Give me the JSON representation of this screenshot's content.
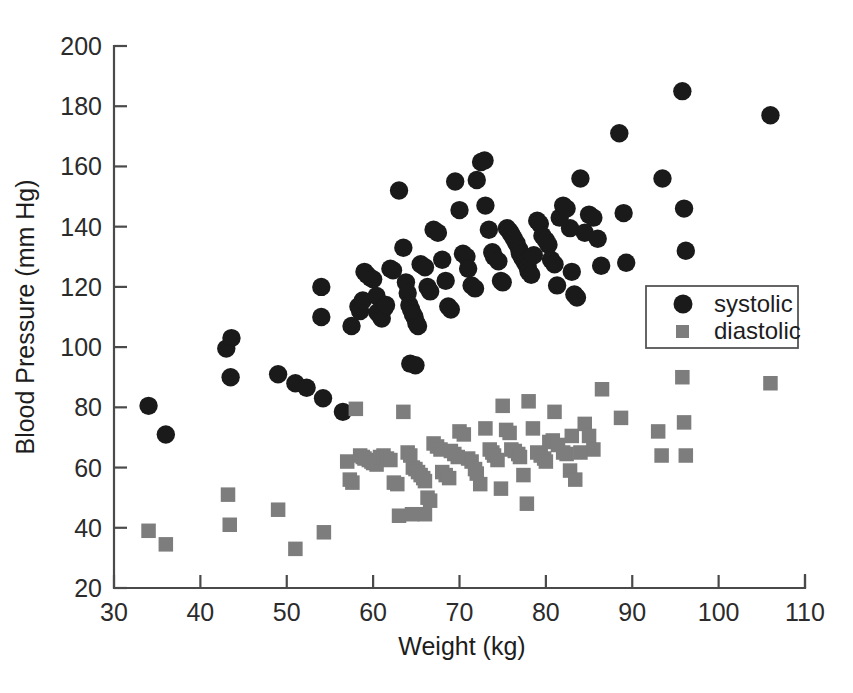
{
  "chart_data": {
    "type": "scatter",
    "title": "",
    "xlabel": "Weight (kg)",
    "ylabel": "Blood Pressure (mm Hg)",
    "xlim": [
      30,
      110
    ],
    "ylim": [
      20,
      200
    ],
    "xticks": [
      30,
      40,
      50,
      60,
      70,
      80,
      90,
      100,
      110
    ],
    "yticks": [
      20,
      40,
      60,
      80,
      100,
      120,
      140,
      160,
      180,
      200
    ],
    "grid": false,
    "legend_position": "center-right",
    "series": [
      {
        "name": "systolic",
        "marker": "circle",
        "color": "#1a1a1a",
        "points": [
          [
            34.0,
            80.5
          ],
          [
            36.0,
            71.0
          ],
          [
            43.0,
            99.5
          ],
          [
            43.6,
            103.0
          ],
          [
            43.5,
            90.0
          ],
          [
            49.0,
            91.0
          ],
          [
            51.0,
            88.0
          ],
          [
            52.3,
            86.5
          ],
          [
            54.2,
            83.0
          ],
          [
            56.5,
            78.5
          ],
          [
            54.0,
            120.0
          ],
          [
            54.0,
            110.0
          ],
          [
            57.5,
            107.0
          ],
          [
            58.3,
            113.5
          ],
          [
            58.5,
            112.0
          ],
          [
            58.8,
            115.5
          ],
          [
            59.0,
            125.0
          ],
          [
            59.3,
            124.0
          ],
          [
            59.7,
            123.0
          ],
          [
            60.0,
            122.5
          ],
          [
            60.4,
            117.0
          ],
          [
            60.5,
            111.5
          ],
          [
            60.8,
            110.5
          ],
          [
            61.0,
            109.5
          ],
          [
            61.3,
            113.0
          ],
          [
            61.5,
            114.0
          ],
          [
            62.0,
            126.0
          ],
          [
            62.3,
            125.5
          ],
          [
            63.0,
            152.0
          ],
          [
            63.5,
            133.0
          ],
          [
            63.8,
            121.5
          ],
          [
            64.0,
            118.0
          ],
          [
            64.2,
            114.0
          ],
          [
            64.4,
            112.5
          ],
          [
            64.6,
            111.0
          ],
          [
            64.8,
            110.0
          ],
          [
            65.0,
            108.0
          ],
          [
            65.2,
            107.0
          ],
          [
            64.3,
            94.5
          ],
          [
            64.9,
            94.0
          ],
          [
            65.5,
            127.5
          ],
          [
            66.0,
            126.5
          ],
          [
            66.3,
            120.0
          ],
          [
            66.6,
            118.5
          ],
          [
            67.0,
            139.0
          ],
          [
            67.5,
            138.0
          ],
          [
            68.0,
            129.0
          ],
          [
            68.4,
            122.0
          ],
          [
            68.7,
            113.5
          ],
          [
            69.0,
            112.5
          ],
          [
            69.5,
            155.0
          ],
          [
            70.0,
            145.5
          ],
          [
            70.4,
            131.0
          ],
          [
            70.8,
            130.0
          ],
          [
            71.0,
            126.0
          ],
          [
            71.4,
            120.5
          ],
          [
            71.8,
            119.5
          ],
          [
            72.0,
            155.5
          ],
          [
            72.5,
            161.5
          ],
          [
            72.9,
            162.0
          ],
          [
            73.0,
            147.0
          ],
          [
            73.4,
            139.0
          ],
          [
            73.8,
            131.5
          ],
          [
            74.0,
            130.0
          ],
          [
            74.5,
            128.5
          ],
          [
            74.8,
            122.0
          ],
          [
            75.0,
            121.5
          ],
          [
            75.5,
            139.5
          ],
          [
            75.8,
            138.5
          ],
          [
            76.0,
            137.5
          ],
          [
            76.3,
            136.0
          ],
          [
            76.6,
            134.5
          ],
          [
            76.9,
            132.5
          ],
          [
            77.0,
            131.0
          ],
          [
            77.3,
            129.5
          ],
          [
            77.6,
            128.0
          ],
          [
            77.9,
            126.5
          ],
          [
            78.0,
            125.0
          ],
          [
            78.3,
            124.0
          ],
          [
            78.6,
            130.5
          ],
          [
            79.0,
            142.0
          ],
          [
            79.3,
            141.0
          ],
          [
            79.6,
            137.0
          ],
          [
            80.0,
            135.5
          ],
          [
            80.3,
            134.0
          ],
          [
            80.6,
            129.0
          ],
          [
            81.0,
            127.5
          ],
          [
            81.3,
            120.5
          ],
          [
            81.6,
            143.0
          ],
          [
            82.0,
            147.0
          ],
          [
            82.4,
            146.0
          ],
          [
            82.8,
            139.5
          ],
          [
            83.0,
            125.0
          ],
          [
            83.3,
            117.5
          ],
          [
            83.6,
            116.5
          ],
          [
            84.0,
            156.0
          ],
          [
            84.5,
            138.0
          ],
          [
            85.0,
            144.0
          ],
          [
            85.5,
            143.0
          ],
          [
            86.0,
            136.0
          ],
          [
            86.4,
            127.0
          ],
          [
            88.5,
            171.0
          ],
          [
            89.0,
            144.5
          ],
          [
            89.3,
            128.0
          ],
          [
            93.5,
            156.0
          ],
          [
            95.8,
            185.0
          ],
          [
            96.0,
            146.0
          ],
          [
            96.2,
            132.0
          ],
          [
            106.0,
            177.0
          ]
        ]
      },
      {
        "name": "diastolic",
        "marker": "square",
        "color": "#7d7d7d",
        "points": [
          [
            34.0,
            39.0
          ],
          [
            36.0,
            34.5
          ],
          [
            43.2,
            51.0
          ],
          [
            43.4,
            41.0
          ],
          [
            49.0,
            46.0
          ],
          [
            51.0,
            33.0
          ],
          [
            54.3,
            38.5
          ],
          [
            57.0,
            62.0
          ],
          [
            57.3,
            56.0
          ],
          [
            57.6,
            55.0
          ],
          [
            58.0,
            79.5
          ],
          [
            58.5,
            64.0
          ],
          [
            58.8,
            63.5
          ],
          [
            59.0,
            63.0
          ],
          [
            59.5,
            62.5
          ],
          [
            59.8,
            62.0
          ],
          [
            60.0,
            61.5
          ],
          [
            60.4,
            61.0
          ],
          [
            60.8,
            63.5
          ],
          [
            61.2,
            64.0
          ],
          [
            61.6,
            63.0
          ],
          [
            62.0,
            62.5
          ],
          [
            62.4,
            55.0
          ],
          [
            62.8,
            54.5
          ],
          [
            63.0,
            44.0
          ],
          [
            63.5,
            78.5
          ],
          [
            64.0,
            65.0
          ],
          [
            64.3,
            64.0
          ],
          [
            64.6,
            60.0
          ],
          [
            64.9,
            59.5
          ],
          [
            65.2,
            58.5
          ],
          [
            65.5,
            57.5
          ],
          [
            65.8,
            56.5
          ],
          [
            66.0,
            55.5
          ],
          [
            66.3,
            50.0
          ],
          [
            66.6,
            49.0
          ],
          [
            64.5,
            44.5
          ],
          [
            66.0,
            44.5
          ],
          [
            67.0,
            68.0
          ],
          [
            67.4,
            67.0
          ],
          [
            67.8,
            66.0
          ],
          [
            68.0,
            58.5
          ],
          [
            68.4,
            57.5
          ],
          [
            68.8,
            56.5
          ],
          [
            69.0,
            65.5
          ],
          [
            69.4,
            64.5
          ],
          [
            69.8,
            63.5
          ],
          [
            70.0,
            72.0
          ],
          [
            70.5,
            71.0
          ],
          [
            71.0,
            63.0
          ],
          [
            71.4,
            62.0
          ],
          [
            71.8,
            59.5
          ],
          [
            72.0,
            58.0
          ],
          [
            72.4,
            54.5
          ],
          [
            73.0,
            73.0
          ],
          [
            73.5,
            66.0
          ],
          [
            73.8,
            65.0
          ],
          [
            74.0,
            64.0
          ],
          [
            74.4,
            62.5
          ],
          [
            74.8,
            53.0
          ],
          [
            75.0,
            80.5
          ],
          [
            75.4,
            72.5
          ],
          [
            75.8,
            71.5
          ],
          [
            76.0,
            66.0
          ],
          [
            76.4,
            65.5
          ],
          [
            76.8,
            64.5
          ],
          [
            77.0,
            63.5
          ],
          [
            77.4,
            57.5
          ],
          [
            77.8,
            48.0
          ],
          [
            78.0,
            82.0
          ],
          [
            78.5,
            73.0
          ],
          [
            79.0,
            65.0
          ],
          [
            79.4,
            64.0
          ],
          [
            79.8,
            63.0
          ],
          [
            80.0,
            62.0
          ],
          [
            80.4,
            68.5
          ],
          [
            80.8,
            69.0
          ],
          [
            81.0,
            78.5
          ],
          [
            81.4,
            67.5
          ],
          [
            82.0,
            65.0
          ],
          [
            82.4,
            64.5
          ],
          [
            82.8,
            59.0
          ],
          [
            83.0,
            70.5
          ],
          [
            83.4,
            56.0
          ],
          [
            84.0,
            65.0
          ],
          [
            84.5,
            74.5
          ],
          [
            85.0,
            70.5
          ],
          [
            85.5,
            66.0
          ],
          [
            86.5,
            86.0
          ],
          [
            88.7,
            76.5
          ],
          [
            93.0,
            72.0
          ],
          [
            93.4,
            64.0
          ],
          [
            95.8,
            90.0
          ],
          [
            96.0,
            75.0
          ],
          [
            96.2,
            64.0
          ],
          [
            106.0,
            88.0
          ]
        ]
      }
    ]
  },
  "axes": {
    "x_tick_labels": [
      "30",
      "40",
      "50",
      "60",
      "70",
      "80",
      "90",
      "100",
      "110"
    ],
    "y_tick_labels": [
      "20",
      "40",
      "60",
      "80",
      "100",
      "120",
      "140",
      "160",
      "180",
      "200"
    ],
    "x_title": "Weight (kg)",
    "y_title": "Blood Pressure (mm Hg)"
  },
  "legend": {
    "entries": [
      {
        "label": "systolic",
        "marker": "circle-marker-icon",
        "color": "#1a1a1a"
      },
      {
        "label": "diastolic",
        "marker": "square-marker-icon",
        "color": "#7d7d7d"
      }
    ]
  },
  "style": {
    "background": "#ffffff",
    "axis_color": "#4a4a4a",
    "systolic_color": "#1a1a1a",
    "diastolic_color": "#7d7d7d"
  }
}
